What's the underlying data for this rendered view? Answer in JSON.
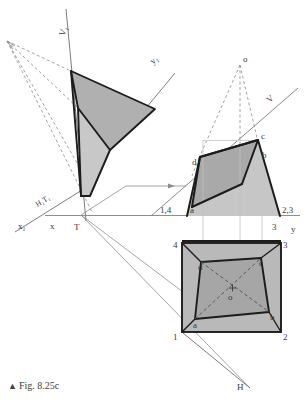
{
  "figure": {
    "caption_marker": "▲",
    "caption_text": "Fig. 8.25c",
    "colors": {
      "fill_dark": "#a8a8a8",
      "fill_mid": "#b4b4b4",
      "fill_light": "#c6c6c6",
      "outline_heavy": "#1a1a1a",
      "outline_thin": "#8a8a8a",
      "dashed": "#7a7a7a",
      "text": "#3a3a3a"
    }
  },
  "labels": {
    "v1_axis": "V₁",
    "y1_axis": "y₁",
    "h1t1_trace": "H₁T₁",
    "x1_axis": "x₁",
    "x_axis": "x",
    "t_point": "T",
    "v_axis": "V",
    "y_axis": "y",
    "h_trace": "H",
    "o_apex": "o",
    "o_plan": "o",
    "front_a": "a",
    "front_b": "b",
    "front_c": "c",
    "front_d": "d",
    "front_left_base": "1,4",
    "front_right_base": "2,3",
    "plan_a": "a",
    "plan_b": "b",
    "plan_c": "c",
    "plan_d": "d",
    "plan_1": "1",
    "plan_2": "2",
    "plan_3": "3",
    "plan_4": "4",
    "front_base_right_small": "3"
  },
  "geometry": {
    "vanishing_point": {
      "x": 7,
      "y": 41
    },
    "apex_o_front": {
      "x": 240,
      "y": 62
    },
    "t_point": {
      "x": 81,
      "y": 215
    },
    "ground_line_y": 215,
    "front_view": {
      "base_left": {
        "x": 187,
        "y": 216
      },
      "base_right": {
        "x": 280,
        "y": 216
      },
      "top_left_d": {
        "x": 200,
        "y": 157
      },
      "top_right_c": {
        "x": 258,
        "y": 140
      }
    },
    "plan_view": {
      "corner_1": {
        "x": 182,
        "y": 332
      },
      "corner_2": {
        "x": 281,
        "y": 332
      },
      "corner_3": {
        "x": 281,
        "y": 243
      },
      "corner_4": {
        "x": 182,
        "y": 243
      },
      "inner_a": {
        "x": 195,
        "y": 319
      },
      "inner_b": {
        "x": 269,
        "y": 312
      },
      "inner_c": {
        "x": 261,
        "y": 258
      },
      "inner_d": {
        "x": 201,
        "y": 262
      },
      "center_o": {
        "x": 232,
        "y": 291
      }
    },
    "aux_view": {
      "p_top": {
        "x": 71,
        "y": 71
      },
      "p_right": {
        "x": 155,
        "y": 109
      },
      "p_mid_right": {
        "x": 110,
        "y": 150
      },
      "p_left_mid": {
        "x": 78,
        "y": 108
      },
      "p_bottom": {
        "x": 90,
        "y": 196
      }
    }
  }
}
